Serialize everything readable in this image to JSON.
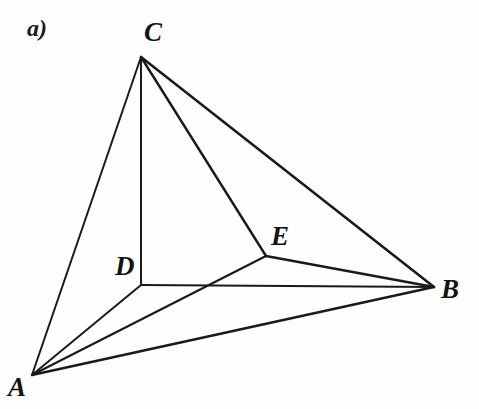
{
  "figure": {
    "part_label": "a)",
    "caption": "",
    "background_color": "#fefefe",
    "stroke_color": "#1a1a1a",
    "width": 479,
    "height": 409
  },
  "chart_data": {
    "type": "diagram",
    "title": "a)",
    "vertices": [
      {
        "id": "A",
        "label": "A",
        "x": 32,
        "y": 375
      },
      {
        "id": "B",
        "label": "B",
        "x": 434,
        "y": 287
      },
      {
        "id": "C",
        "label": "C",
        "x": 141,
        "y": 57
      },
      {
        "id": "D",
        "label": "D",
        "x": 141,
        "y": 285
      },
      {
        "id": "E",
        "label": "E",
        "x": 266,
        "y": 256
      }
    ],
    "edges": [
      {
        "from": "A",
        "to": "C",
        "width": 2.0
      },
      {
        "from": "A",
        "to": "D",
        "width": 2.0
      },
      {
        "from": "A",
        "to": "E",
        "width": 2.2
      },
      {
        "from": "A",
        "to": "B",
        "width": 2.4
      },
      {
        "from": "C",
        "to": "D",
        "width": 2.0
      },
      {
        "from": "C",
        "to": "E",
        "width": 2.4
      },
      {
        "from": "C",
        "to": "B",
        "width": 2.6
      },
      {
        "from": "D",
        "to": "B",
        "width": 2.0
      },
      {
        "from": "E",
        "to": "B",
        "width": 2.4
      }
    ],
    "label_positions": [
      {
        "id": "A",
        "x": 8,
        "y": 374,
        "anchor": "below-left"
      },
      {
        "id": "B",
        "x": 441,
        "y": 276,
        "anchor": "right"
      },
      {
        "id": "C",
        "x": 144,
        "y": 19,
        "anchor": "above"
      },
      {
        "id": "D",
        "x": 115,
        "y": 253,
        "anchor": "left"
      },
      {
        "id": "E",
        "x": 271,
        "y": 223,
        "anchor": "above-right"
      }
    ],
    "xlim": [
      0,
      479
    ],
    "ylim": [
      0,
      409
    ],
    "grid": false,
    "legend": false
  }
}
